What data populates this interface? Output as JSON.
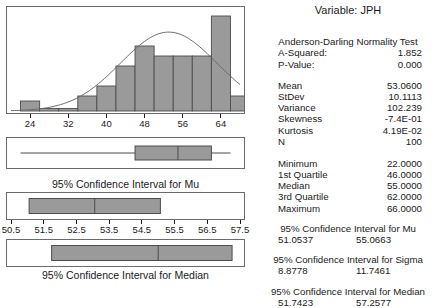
{
  "variable_title": "Variable: JPH",
  "anderson_darling": {
    "title": "Anderson-Darling Normality Test",
    "rows": [
      {
        "label": "A-Squared:",
        "value": "1.852"
      },
      {
        "label": "P-Value:",
        "value": "0.000"
      }
    ]
  },
  "descriptive_stats": [
    {
      "label": "Mean",
      "value": "53.0600"
    },
    {
      "label": "StDev",
      "value": "10.1113"
    },
    {
      "label": "Variance",
      "value": "102.239"
    },
    {
      "label": "Skewness",
      "value": "-7.4E-01"
    },
    {
      "label": "Kurtosis",
      "value": "4.19E-02"
    },
    {
      "label": "N",
      "value": "100"
    }
  ],
  "quartile_stats": [
    {
      "label": "Minimum",
      "value": "22.0000"
    },
    {
      "label": "1st Quartile",
      "value": "46.0000"
    },
    {
      "label": "Median",
      "value": "55.0000"
    },
    {
      "label": "3rd Quartile",
      "value": "62.0000"
    },
    {
      "label": "Maximum",
      "value": "66.0000"
    }
  ],
  "confidence_intervals": [
    {
      "title": "95% Confidence Interval for Mu",
      "lower": "51.0537",
      "upper": "55.0663"
    },
    {
      "title": "95% Confidence Interval for Sigma",
      "lower": "8.8778",
      "upper": "11.7461"
    },
    {
      "title": "95% Confidence Interval for Median",
      "lower": "51.7423",
      "upper": "57.2577"
    }
  ],
  "captions": {
    "ci_mu": "95% Confidence Interval for Mu",
    "ci_median": "95% Confidence Interval for Median"
  },
  "colors": {
    "bar_fill": "#9a9a9a",
    "bar_stroke": "#4d4d4d",
    "panel_border": "#6b6b6b",
    "curve": "#6b6b6b",
    "text": "#1a1a1a",
    "background": "#ffffff"
  },
  "chart_data": [
    {
      "type": "bar",
      "name": "histogram-with-normal-curve",
      "title": "",
      "xlabel": "",
      "ylabel": "",
      "xlim": [
        20,
        68
      ],
      "ylim": [
        0,
        20
      ],
      "grid": false,
      "legend": false,
      "tick_labels": [
        "24",
        "32",
        "40",
        "48",
        "56",
        "64"
      ],
      "ticks": [
        24,
        32,
        40,
        48,
        56,
        64
      ],
      "bin_width": 4,
      "bin_starts": [
        22,
        26,
        30,
        34,
        38,
        42,
        46,
        50,
        54,
        58,
        62,
        66
      ],
      "categories": [
        "22-26",
        "26-30",
        "30-34",
        "34-38",
        "38-42",
        "42-46",
        "46-50",
        "50-54",
        "54-58",
        "58-62",
        "62-66",
        "66-70"
      ],
      "values": [
        2,
        0.5,
        0.5,
        3,
        5,
        9,
        13,
        11,
        11,
        11,
        19,
        3
      ],
      "normal_curve": {
        "mean": 53.06,
        "stdev": 10.1113,
        "n": 100,
        "visible": true
      }
    },
    {
      "type": "boxplot",
      "name": "boxplot-of-data",
      "xlim": [
        20,
        68
      ],
      "whisker_low": 22,
      "q1": 46,
      "median": 55,
      "q3": 62,
      "whisker_high": 66,
      "outliers": []
    },
    {
      "type": "interval",
      "name": "ci-for-mu-plot",
      "xlim": [
        50.5,
        57.5
      ],
      "ticks": [
        50.5,
        51.5,
        52.5,
        53.5,
        54.5,
        55.5,
        56.5,
        57.5
      ],
      "tick_labels": [
        "50.5",
        "51.5",
        "52.5",
        "53.5",
        "54.5",
        "55.5",
        "56.5",
        "57.5"
      ],
      "lower": 51.0537,
      "center": 53.06,
      "upper": 55.0663,
      "caption": "95% Confidence Interval for Mu"
    },
    {
      "type": "interval",
      "name": "ci-for-median-plot",
      "xlim": [
        50.5,
        57.5
      ],
      "lower": 51.7423,
      "center": 55.0,
      "upper": 57.2577,
      "caption": "95% Confidence Interval for Median"
    }
  ]
}
